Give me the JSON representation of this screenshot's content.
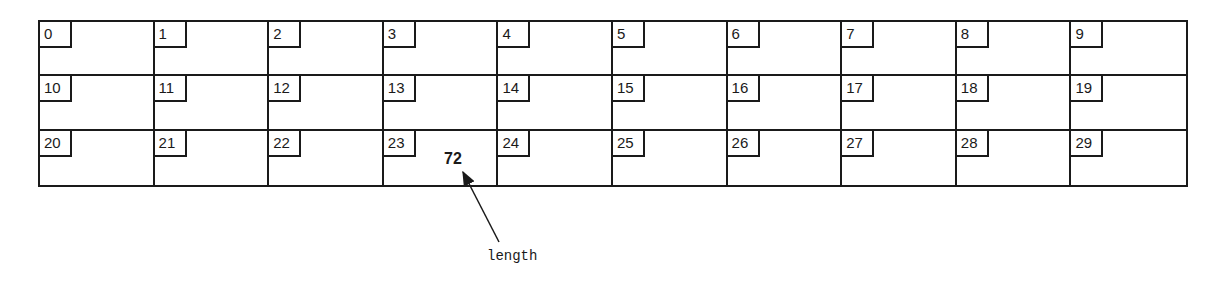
{
  "diagram": {
    "type": "array",
    "rows": 3,
    "columns": 10,
    "indices": [
      "0",
      "1",
      "2",
      "3",
      "4",
      "5",
      "6",
      "7",
      "8",
      "9",
      "10",
      "11",
      "12",
      "13",
      "14",
      "15",
      "16",
      "17",
      "18",
      "19",
      "20",
      "21",
      "22",
      "23",
      "24",
      "25",
      "26",
      "27",
      "28",
      "29"
    ],
    "values": {
      "23": "72"
    },
    "annotation": {
      "value": "72",
      "label": "length",
      "points_to_index": "23"
    }
  }
}
